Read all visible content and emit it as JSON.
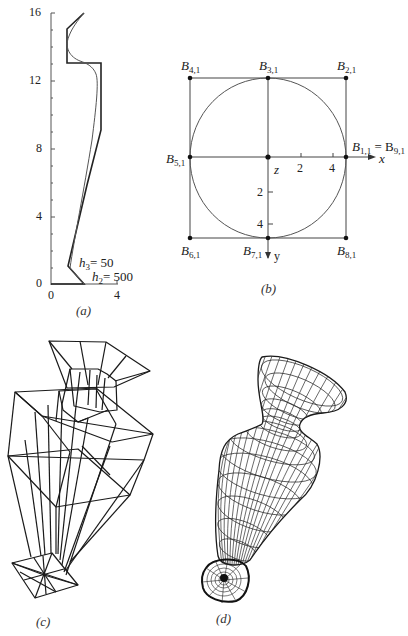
{
  "panel_a": {
    "caption": "(a)",
    "y_ticks": [
      "16",
      "12",
      "8",
      "4",
      "0"
    ],
    "x_ticks": [
      "0",
      "4"
    ],
    "annotations": [
      {
        "var": "h",
        "sub": "3",
        "text": "= 50"
      },
      {
        "var": "h",
        "sub": "2",
        "text": "= 500"
      }
    ]
  },
  "panel_b": {
    "caption": "(b)",
    "points": [
      {
        "name": "B",
        "sub": "4,1"
      },
      {
        "name": "B",
        "sub": "3,1"
      },
      {
        "name": "B",
        "sub": "2,1"
      },
      {
        "name": "B",
        "sub": "5,1"
      },
      {
        "name": "B",
        "sub": "1,1",
        "eq": "= B",
        "eq_sub": "9,1"
      },
      {
        "name": "B",
        "sub": "6,1"
      },
      {
        "name": "B",
        "sub": "7,1"
      },
      {
        "name": "B",
        "sub": "8,1"
      }
    ],
    "axis_labels": {
      "x": "x",
      "y": "y",
      "z": "z"
    },
    "x_ticks": [
      "2",
      "4"
    ],
    "y_ticks": [
      "2",
      "4"
    ]
  },
  "panel_c": {
    "caption": "(c)"
  },
  "panel_d": {
    "caption": "(d)"
  }
}
